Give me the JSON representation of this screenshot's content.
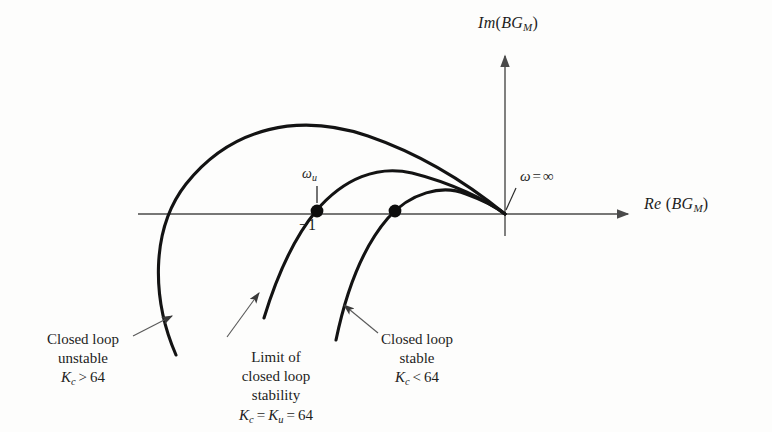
{
  "figure": {
    "type": "nyquist-plot",
    "background_color": "#fdfdfc",
    "ink_color": "#1d1d1d",
    "axis_color": "#4a4a4a"
  },
  "axes": {
    "y_label": {
      "prefix": "Im",
      "open": "(",
      "main": "BG",
      "sub": "M",
      "close": ")"
    },
    "x_label": {
      "prefix": "Re",
      "open": "(",
      "main": "BG",
      "sub": "M",
      "close": ")"
    },
    "origin": {
      "x": 505,
      "y": 214
    }
  },
  "annotations": {
    "omega_infinity": {
      "symbol": "ω",
      "equals": "=",
      "value": "∞"
    },
    "omega_u": {
      "symbol": "ω",
      "sub": "u"
    },
    "critical_point": {
      "label": "−1"
    }
  },
  "captions": [
    {
      "id": "unstable",
      "line1": "Closed loop",
      "line2": "unstable",
      "k_symbol": "K",
      "k_sub": "c",
      "k_op": ">",
      "k_value": "64"
    },
    {
      "id": "limit",
      "line1": "Limit of",
      "line2": "closed loop",
      "line3": "stability",
      "k_symbol": "K",
      "k_sub": "c",
      "k_op": "=",
      "k_symbol2": "K",
      "k_sub2": "u",
      "k_op2": "=",
      "k_value": "64"
    },
    {
      "id": "stable",
      "line1": "Closed loop",
      "line2": "stable",
      "k_symbol": "K",
      "k_sub": "c",
      "k_op": "<",
      "k_value": "64"
    }
  ],
  "chart_data": {
    "type": "line",
    "title": "",
    "xlabel": "Re (BG_M)",
    "ylabel": "Im (BG_M)",
    "grid": false,
    "legend": "none",
    "origin_px": [
      505,
      214
    ],
    "critical_point_px": [
      317,
      211
    ],
    "series": [
      {
        "name": "Kc > 64 (closed loop unstable)",
        "encircles_minus_one": true,
        "real_axis_crossing_px": [
          317,
          211
        ],
        "apex_px": [
          368,
          135
        ],
        "path": "M 176,355 C 152,300 150,230 186,184 C 232,126 300,113 368,136 C 432,158 478,192 505,214"
      },
      {
        "name": "Kc = Ku = 64 (limit of closed loop stability)",
        "encircles_minus_one": false,
        "real_axis_crossing_px": [
          317,
          211
        ],
        "apex_px": [
          404,
          172
        ],
        "path": "M 264,318 C 278,272 294,238 316,211 C 344,178 378,165 412,173 C 452,183 486,200 505,214"
      },
      {
        "name": "Kc < 64 (closed loop stable)",
        "encircles_minus_one": false,
        "real_axis_crossing_px": [
          395,
          211
        ],
        "apex_px": [
          440,
          190
        ],
        "path": "M 336,340 C 346,292 362,248 388,218 C 410,193 442,184 466,194 C 488,202 499,209 505,214"
      }
    ]
  }
}
